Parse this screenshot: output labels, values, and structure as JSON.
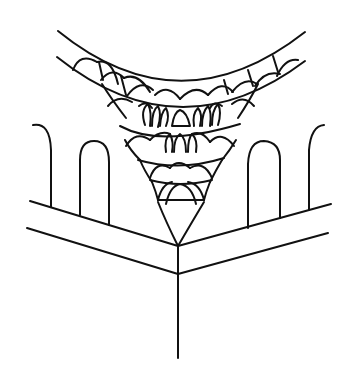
{
  "figure": {
    "ink_color": "#111111",
    "background_color": "#ffffff"
  }
}
